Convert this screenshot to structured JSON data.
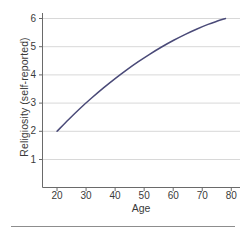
{
  "chart_data": {
    "type": "line",
    "title": "",
    "xlabel": "Age",
    "ylabel": "Religiosity (self-reported)",
    "xlim": [
      15,
      83
    ],
    "ylim": [
      0,
      6.35
    ],
    "xticks": [
      20,
      30,
      40,
      50,
      60,
      70,
      80
    ],
    "yticks": [
      1,
      2,
      3,
      4,
      5,
      6
    ],
    "xtick_labels": [
      "20",
      "30",
      "40",
      "50",
      "60",
      "70",
      "80"
    ],
    "ytick_labels": [
      "1",
      "2",
      "3",
      "4",
      "5",
      "6"
    ],
    "grid": "horizontal",
    "legend": "none",
    "series": [
      {
        "name": "Religiosity by age",
        "color": "#4a4a78",
        "line_width": 1.5,
        "x": [
          20,
          24,
          28,
          32,
          36,
          40,
          44,
          48,
          52,
          56,
          60,
          64,
          68,
          72,
          75,
          78
        ],
        "y": [
          2.0,
          2.42,
          2.82,
          3.19,
          3.54,
          3.87,
          4.18,
          4.47,
          4.74,
          4.99,
          5.22,
          5.43,
          5.62,
          5.79,
          5.9,
          6.0
        ]
      }
    ],
    "annotations": []
  },
  "axis": {
    "line_color": "#6a6a6a",
    "grid_color": "#d8d8d8",
    "tick_color": "#6a6a6a",
    "text_color": "#3a3a3a"
  },
  "figure": {
    "background": "#ffffff",
    "bottom_rule_color": "#8d8d8d"
  }
}
